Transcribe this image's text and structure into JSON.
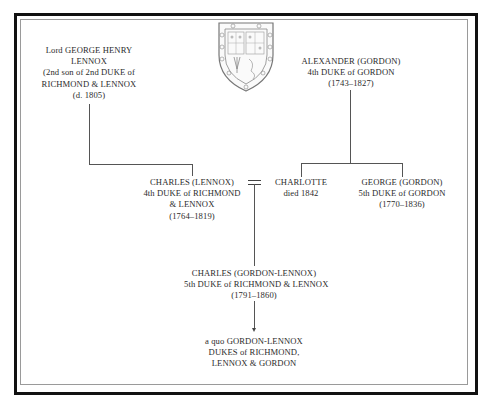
{
  "diagram": {
    "type": "family-tree",
    "coat_of_arms": "shield-icon",
    "nodes": {
      "george_henry": {
        "lines": [
          "Lord GEORGE HENRY",
          "LENNOX",
          "(2nd son of 2nd DUKE of",
          "RICHMOND & LENNOX",
          "(d. 1805)"
        ]
      },
      "alexander": {
        "lines": [
          "ALEXANDER (GORDON)",
          "4th DUKE of GORDON",
          "(1743–1827)"
        ]
      },
      "charles_lennox": {
        "lines": [
          "CHARLES (LENNOX)",
          "4th DUKE of RICHMOND",
          "& LENNOX",
          "(1764–1819)"
        ]
      },
      "charlotte": {
        "lines": [
          "CHARLOTTE",
          "died 1842"
        ]
      },
      "george_gordon": {
        "lines": [
          "GEORGE (GORDON)",
          "5th DUKE of GORDON",
          "(1770–1836)"
        ]
      },
      "charles_gordon_lennox": {
        "lines": [
          "CHARLES (GORDON-LENNOX)",
          "5th DUKE of RICHMOND & LENNOX",
          "(1791–1860)"
        ]
      },
      "descendants": {
        "lines": [
          "a quo GORDON-LENNOX",
          "DUKES of RICHMOND,",
          "LENNOX & GORDON"
        ]
      }
    },
    "edges": [
      {
        "from": "george_henry",
        "to": "charles_lennox",
        "type": "parent-child"
      },
      {
        "from": "alexander",
        "to": "charlotte",
        "type": "parent-child"
      },
      {
        "from": "alexander",
        "to": "george_gordon",
        "type": "parent-child"
      },
      {
        "from": "charles_lennox",
        "to": "charlotte",
        "type": "marriage",
        "symbol": "="
      },
      {
        "from": "charles_lennox+charlotte",
        "to": "charles_gordon_lennox",
        "type": "parent-child"
      },
      {
        "from": "charles_gordon_lennox",
        "to": "descendants",
        "type": "descent-arrow"
      }
    ],
    "colors": {
      "frame": "#111111",
      "inner_rule": "#9a9a9a",
      "lines": "#555555",
      "text": "#2b2b2b"
    }
  }
}
